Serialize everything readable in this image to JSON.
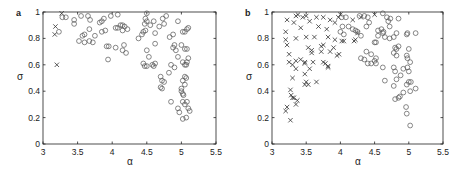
{
  "chart_data": [
    {
      "panel": "a",
      "type": "scatter",
      "title": "",
      "xlabel": "α",
      "ylabel": "σ",
      "xlim": [
        3,
        5.5
      ],
      "ylim": [
        0,
        1
      ],
      "xticks": [
        "3",
        "3.5",
        "4",
        "4.5",
        "5",
        "5.5"
      ],
      "yticks": [
        "0",
        "0.2",
        "0.4",
        "0.6",
        "0.8",
        "1"
      ],
      "grid": false,
      "legend": null,
      "series": [
        {
          "name": "crosses",
          "marker": "x",
          "points": [
            [
              3.18,
              0.89
            ],
            [
              3.17,
              0.83
            ],
            [
              3.2,
              0.6
            ],
            [
              3.27,
              0.99
            ]
          ]
        },
        {
          "name": "circles",
          "marker": "o",
          "points": [
            [
              3.23,
              0.85
            ],
            [
              3.28,
              0.96
            ],
            [
              3.33,
              0.96
            ],
            [
              3.45,
              0.94
            ],
            [
              3.45,
              0.91
            ],
            [
              3.55,
              0.97
            ],
            [
              3.65,
              0.97
            ],
            [
              3.68,
              0.94
            ],
            [
              3.57,
              0.82
            ],
            [
              3.6,
              0.83
            ],
            [
              3.52,
              0.78
            ],
            [
              3.6,
              0.77
            ],
            [
              3.67,
              0.78
            ],
            [
              3.72,
              0.77
            ],
            [
              3.67,
              0.87
            ],
            [
              3.75,
              0.82
            ],
            [
              3.82,
              0.92
            ],
            [
              3.85,
              0.93
            ],
            [
              3.88,
              0.95
            ],
            [
              3.9,
              0.86
            ],
            [
              3.85,
              0.85
            ],
            [
              3.98,
              0.97
            ],
            [
              4.08,
              0.98
            ],
            [
              3.92,
              0.74
            ],
            [
              3.95,
              0.74
            ],
            [
              3.94,
              0.64
            ],
            [
              4.05,
              0.88
            ],
            [
              4.08,
              0.88
            ],
            [
              4.12,
              0.9
            ],
            [
              4.15,
              0.9
            ],
            [
              4.18,
              0.89
            ],
            [
              4.22,
              0.87
            ],
            [
              4.15,
              0.86
            ],
            [
              4.05,
              0.73
            ],
            [
              4.15,
              0.71
            ],
            [
              4.17,
              0.75
            ],
            [
              4.2,
              0.69
            ],
            [
              4.38,
              0.8
            ],
            [
              4.43,
              0.83
            ],
            [
              4.45,
              0.85
            ],
            [
              4.48,
              0.86
            ],
            [
              4.47,
              0.91
            ],
            [
              4.48,
              0.95
            ],
            [
              4.5,
              0.93
            ],
            [
              4.5,
              0.99
            ],
            [
              4.55,
              0.9
            ],
            [
              4.6,
              0.93
            ],
            [
              4.62,
              0.84
            ],
            [
              4.68,
              0.89
            ],
            [
              4.73,
              0.95
            ],
            [
              4.75,
              0.91
            ],
            [
              4.78,
              0.97
            ],
            [
              4.83,
              0.81
            ],
            [
              4.88,
              0.83
            ],
            [
              4.95,
              0.93
            ],
            [
              4.62,
              0.76
            ],
            [
              4.5,
              0.71
            ],
            [
              4.53,
              0.66
            ],
            [
              4.45,
              0.61
            ],
            [
              4.47,
              0.59
            ],
            [
              4.5,
              0.59
            ],
            [
              4.58,
              0.6
            ],
            [
              4.6,
              0.59
            ],
            [
              4.62,
              0.61
            ],
            [
              4.7,
              0.51
            ],
            [
              4.72,
              0.48
            ],
            [
              4.75,
              0.47
            ],
            [
              4.7,
              0.43
            ],
            [
              4.72,
              0.42
            ],
            [
              4.82,
              0.54
            ],
            [
              4.85,
              0.6
            ],
            [
              4.9,
              0.58
            ],
            [
              4.88,
              0.73
            ],
            [
              4.9,
              0.75
            ],
            [
              4.92,
              0.71
            ],
            [
              4.95,
              0.66
            ],
            [
              5.0,
              0.75
            ],
            [
              5.02,
              0.62
            ],
            [
              5.05,
              0.6
            ],
            [
              5.07,
              0.6
            ],
            [
              5.08,
              0.62
            ],
            [
              5.1,
              0.65
            ],
            [
              5.05,
              0.72
            ],
            [
              5.08,
              0.72
            ],
            [
              5.05,
              0.85
            ],
            [
              5.08,
              0.87
            ],
            [
              5.1,
              0.88
            ],
            [
              5.02,
              0.85
            ],
            [
              5.05,
              0.51
            ],
            [
              5.07,
              0.5
            ],
            [
              5.02,
              0.48
            ],
            [
              5.05,
              0.45
            ],
            [
              5.0,
              0.42
            ],
            [
              5.0,
              0.4
            ],
            [
              5.02,
              0.38
            ],
            [
              5.03,
              0.37
            ],
            [
              5.02,
              0.32
            ],
            [
              5.08,
              0.32
            ],
            [
              5.05,
              0.3
            ],
            [
              5.1,
              0.27
            ],
            [
              5.12,
              0.25
            ],
            [
              4.95,
              0.27
            ],
            [
              4.97,
              0.24
            ],
            [
              5.02,
              0.19
            ],
            [
              5.07,
              0.2
            ],
            [
              4.85,
              0.32
            ]
          ]
        }
      ]
    },
    {
      "panel": "b",
      "type": "scatter",
      "title": "",
      "xlabel": "α",
      "ylabel": "σ",
      "xlim": [
        3,
        5.5
      ],
      "ylim": [
        0,
        1
      ],
      "xticks": [
        "3",
        "3.5",
        "4",
        "4.5",
        "5",
        "5.5"
      ],
      "yticks": [
        "0",
        "0.2",
        "0.4",
        "0.6",
        "0.8",
        "1"
      ],
      "grid": false,
      "legend": null,
      "series": [
        {
          "name": "crosses",
          "marker": "x",
          "points": [
            [
              3.22,
              0.94
            ],
            [
              3.35,
              0.97
            ],
            [
              3.38,
              0.98
            ],
            [
              3.45,
              0.96
            ],
            [
              3.5,
              0.97
            ],
            [
              3.55,
              0.93
            ],
            [
              3.65,
              0.96
            ],
            [
              3.75,
              0.96
            ],
            [
              3.85,
              0.94
            ],
            [
              3.92,
              0.92
            ],
            [
              3.97,
              0.96
            ],
            [
              4.0,
              0.98
            ],
            [
              3.2,
              0.85
            ],
            [
              3.32,
              0.92
            ],
            [
              3.42,
              0.88
            ],
            [
              3.68,
              0.89
            ],
            [
              3.8,
              0.87
            ],
            [
              3.2,
              0.79
            ],
            [
              3.22,
              0.75
            ],
            [
              3.35,
              0.8
            ],
            [
              3.5,
              0.81
            ],
            [
              3.62,
              0.81
            ],
            [
              3.82,
              0.81
            ],
            [
              3.92,
              0.79
            ],
            [
              4.02,
              0.78
            ],
            [
              4.05,
              0.78
            ],
            [
              4.2,
              0.78
            ],
            [
              4.22,
              0.79
            ],
            [
              4.25,
              0.84
            ],
            [
              4.18,
              0.94
            ],
            [
              4.3,
              0.96
            ],
            [
              4.5,
              0.98
            ],
            [
              3.53,
              0.73
            ],
            [
              3.58,
              0.69
            ],
            [
              3.58,
              0.71
            ],
            [
              3.72,
              0.74
            ],
            [
              3.75,
              0.75
            ],
            [
              3.72,
              0.7
            ],
            [
              3.85,
              0.7
            ],
            [
              3.95,
              0.67
            ],
            [
              3.98,
              0.68
            ],
            [
              3.9,
              0.73
            ],
            [
              3.25,
              0.68
            ],
            [
              3.25,
              0.62
            ],
            [
              3.3,
              0.6
            ],
            [
              3.35,
              0.63
            ],
            [
              3.42,
              0.64
            ],
            [
              3.48,
              0.62
            ],
            [
              3.48,
              0.61
            ],
            [
              3.6,
              0.62
            ],
            [
              3.75,
              0.62
            ],
            [
              3.78,
              0.61
            ],
            [
              3.82,
              0.58
            ],
            [
              3.82,
              0.59
            ],
            [
              3.35,
              0.57
            ],
            [
              3.3,
              0.5
            ],
            [
              3.48,
              0.53
            ],
            [
              3.5,
              0.47
            ],
            [
              3.48,
              0.45
            ],
            [
              3.53,
              0.45
            ],
            [
              3.55,
              0.57
            ],
            [
              3.65,
              0.47
            ],
            [
              3.27,
              0.41
            ],
            [
              3.28,
              0.37
            ],
            [
              3.3,
              0.35
            ],
            [
              3.32,
              0.35
            ],
            [
              3.35,
              0.3
            ],
            [
              3.37,
              0.33
            ],
            [
              3.22,
              0.28
            ],
            [
              3.2,
              0.25
            ],
            [
              3.27,
              0.18
            ]
          ]
        },
        {
          "name": "circles",
          "marker": "o",
          "points": [
            [
              4.02,
              0.96
            ],
            [
              4.08,
              0.96
            ],
            [
              4.28,
              0.97
            ],
            [
              4.35,
              0.97
            ],
            [
              4.4,
              0.96
            ],
            [
              4.62,
              0.99
            ],
            [
              4.68,
              0.96
            ],
            [
              4.73,
              0.95
            ],
            [
              4.85,
              0.95
            ],
            [
              4.7,
              0.93
            ],
            [
              4.42,
              0.92
            ],
            [
              4.03,
              0.89
            ],
            [
              4.12,
              0.89
            ],
            [
              4.18,
              0.87
            ],
            [
              4.0,
              0.85
            ],
            [
              4.05,
              0.83
            ],
            [
              4.22,
              0.86
            ],
            [
              4.25,
              0.85
            ],
            [
              4.3,
              0.82
            ],
            [
              4.38,
              0.89
            ],
            [
              4.55,
              0.86
            ],
            [
              4.6,
              0.87
            ],
            [
              4.62,
              0.84
            ],
            [
              4.65,
              0.81
            ],
            [
              4.72,
              0.89
            ],
            [
              4.78,
              0.81
            ],
            [
              4.82,
              0.84
            ],
            [
              4.97,
              0.83
            ],
            [
              4.98,
              0.84
            ],
            [
              5.1,
              0.84
            ],
            [
              4.5,
              0.77
            ],
            [
              4.52,
              0.77
            ],
            [
              4.55,
              0.82
            ],
            [
              4.63,
              0.85
            ],
            [
              4.72,
              0.8
            ],
            [
              4.8,
              0.73
            ],
            [
              4.82,
              0.72
            ],
            [
              4.85,
              0.74
            ],
            [
              4.78,
              0.69
            ],
            [
              4.82,
              0.67
            ],
            [
              5.0,
              0.72
            ],
            [
              5.02,
              0.62
            ],
            [
              4.97,
              0.67
            ],
            [
              4.98,
              0.65
            ],
            [
              4.92,
              0.57
            ],
            [
              5.0,
              0.55
            ],
            [
              4.3,
              0.65
            ],
            [
              4.35,
              0.64
            ],
            [
              4.4,
              0.61
            ],
            [
              4.45,
              0.61
            ],
            [
              4.38,
              0.7
            ],
            [
              4.45,
              0.68
            ],
            [
              4.5,
              0.63
            ],
            [
              4.52,
              0.61
            ],
            [
              4.62,
              0.58
            ],
            [
              4.52,
              0.65
            ],
            [
              4.78,
              0.58
            ],
            [
              4.8,
              0.55
            ],
            [
              4.82,
              0.49
            ],
            [
              4.78,
              0.44
            ],
            [
              4.65,
              0.48
            ],
            [
              4.88,
              0.52
            ],
            [
              4.97,
              0.45
            ],
            [
              5.0,
              0.47
            ],
            [
              5.03,
              0.47
            ],
            [
              5.02,
              0.4
            ],
            [
              5.1,
              0.42
            ],
            [
              4.92,
              0.39
            ],
            [
              4.8,
              0.34
            ],
            [
              4.85,
              0.35
            ],
            [
              4.87,
              0.36
            ],
            [
              4.96,
              0.28
            ],
            [
              4.97,
              0.23
            ],
            [
              5.02,
              0.14
            ],
            [
              4.98,
              0.58
            ]
          ]
        }
      ]
    }
  ],
  "panels": [
    {
      "label": "a",
      "xlabel": "α",
      "ylabel": "σ"
    },
    {
      "label": "b",
      "xlabel": "α",
      "ylabel": "σ"
    }
  ],
  "style": {
    "axis_color": "#222222",
    "marker_color": "#555555",
    "cross_color": "#333333"
  }
}
